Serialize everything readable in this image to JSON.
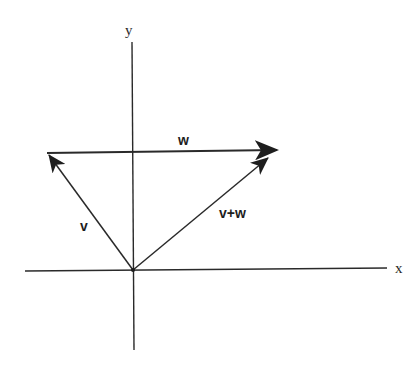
{
  "diagram": {
    "axes": {
      "x_label": "x",
      "y_label": "y"
    },
    "vectors": [
      {
        "name": "v",
        "label": "v",
        "from": [
          133,
          270
        ],
        "to": [
          47,
          152
        ]
      },
      {
        "name": "w",
        "label": "w",
        "from": [
          47,
          152
        ],
        "to": [
          277,
          150
        ]
      },
      {
        "name": "v+w",
        "label": "v+w",
        "from": [
          133,
          270
        ],
        "to": [
          277,
          150
        ]
      }
    ],
    "colors": {
      "ink": "#2a2a2a",
      "background": "#ffffff"
    }
  }
}
